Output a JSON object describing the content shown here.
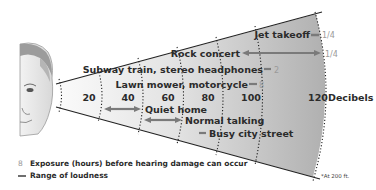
{
  "figure": {
    "axis_unit_label": "Decibels",
    "ticks": [
      "20",
      "40",
      "60",
      "80",
      "100",
      "120"
    ],
    "sounds": [
      {
        "label": "Jet takeoff",
        "exposure": "1/4",
        "range_db": [
          118,
          120
        ]
      },
      {
        "label": "Rock concert",
        "exposure": "1/4",
        "range_db": [
          84,
          120
        ]
      },
      {
        "label": "Subway train, stereo headphones",
        "exposure": "2",
        "range_db": [
          100,
          102
        ]
      },
      {
        "label": "Lawn mower, motorcycle",
        "exposure": "8",
        "range_db": [
          90,
          92
        ]
      },
      {
        "label": "Quiet home",
        "range_db": [
          21,
          40
        ]
      },
      {
        "label": "Normal talking",
        "range_db": [
          40,
          60
        ]
      },
      {
        "label": "Busy city street",
        "range_db": [
          68,
          70
        ]
      }
    ],
    "colors": {
      "cone_light": "#f4f4f4",
      "cone_dark": "#b4b4b4",
      "arrow": "#7a7a7a",
      "text": "#2b2b2b",
      "exposure_text": "#9a9a9a"
    }
  },
  "legend": {
    "exposure_marker": "8",
    "exposure_text": "Exposure (hours) before hearing damage can occur",
    "range_text": "Range of loudness"
  },
  "footnote": "*At 200 ft."
}
